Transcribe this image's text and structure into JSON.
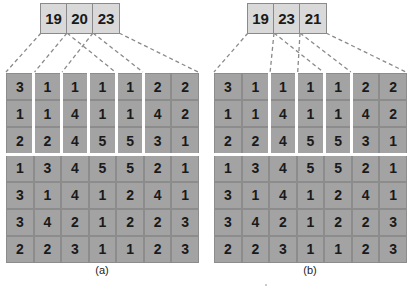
{
  "panels": [
    {
      "id": "a",
      "caption": "(a)",
      "sums": [
        "19",
        "20",
        "23"
      ],
      "groups": [
        [
          0
        ],
        [
          1
        ],
        [
          2
        ],
        [
          3
        ],
        [
          4
        ],
        [
          5,
          6
        ]
      ],
      "matrix": [
        [
          "3",
          "1",
          "1",
          "1",
          "1",
          "2",
          "2"
        ],
        [
          "1",
          "1",
          "4",
          "1",
          "1",
          "4",
          "2"
        ],
        [
          "2",
          "2",
          "4",
          "5",
          "5",
          "3",
          "1"
        ],
        [
          "1",
          "3",
          "4",
          "5",
          "5",
          "2",
          "1"
        ],
        [
          "3",
          "1",
          "4",
          "1",
          "2",
          "4",
          "1"
        ],
        [
          "3",
          "4",
          "2",
          "1",
          "2",
          "2",
          "3"
        ],
        [
          "2",
          "2",
          "3",
          "1",
          "1",
          "2",
          "3"
        ]
      ]
    },
    {
      "id": "b",
      "caption": "(b)",
      "sums": [
        "19",
        "23",
        "21"
      ],
      "groups": [
        [
          0,
          1
        ],
        [
          2
        ],
        [
          3
        ],
        [
          4
        ],
        [
          5,
          6
        ]
      ],
      "matrix": [
        [
          "3",
          "1",
          "1",
          "1",
          "1",
          "2",
          "2"
        ],
        [
          "1",
          "1",
          "4",
          "1",
          "1",
          "4",
          "2"
        ],
        [
          "2",
          "2",
          "4",
          "5",
          "5",
          "3",
          "1"
        ],
        [
          "1",
          "3",
          "4",
          "5",
          "5",
          "2",
          "1"
        ],
        [
          "3",
          "1",
          "4",
          "1",
          "2",
          "4",
          "1"
        ],
        [
          "3",
          "4",
          "2",
          "1",
          "2",
          "2",
          "3"
        ],
        [
          "2",
          "2",
          "3",
          "1",
          "1",
          "2",
          "3"
        ]
      ]
    }
  ],
  "grouped_rows": 3
}
